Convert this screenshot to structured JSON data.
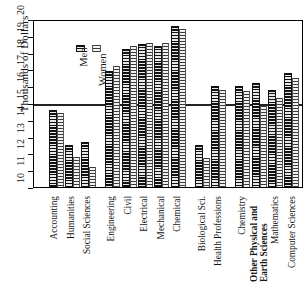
{
  "chart_data": {
    "type": "bar",
    "title": "",
    "xlabel": "",
    "ylabel": "Thousands of Dollars",
    "ylim": [
      10,
      20
    ],
    "ytick_labels": [
      "10",
      "11",
      "12",
      "13",
      "14",
      "15",
      "16",
      "17",
      "18",
      "19",
      "20"
    ],
    "grid": "single horizontal line at 15",
    "legend_position": "top-left inside plot",
    "categories": [
      "Accounting",
      "Humanities",
      "Social Sciences",
      "Engineering",
      "Civil",
      "Electrical",
      "Mechanical",
      "Chemical",
      "Biological Sci.",
      "Health Professions",
      "Chemistry",
      "Other Physical and Earth Sciences",
      "Mathematics",
      "Computer Sciences"
    ],
    "series": [
      {
        "name": "Men",
        "values": [
          14.6,
          12.5,
          12.7,
          16.9,
          18.2,
          18.5,
          18.4,
          19.6,
          12.5,
          16.0,
          16.0,
          16.2,
          15.8,
          16.8
        ]
      },
      {
        "name": "Women",
        "values": [
          14.4,
          11.8,
          11.2,
          17.2,
          18.4,
          18.6,
          18.6,
          19.4,
          11.7,
          15.8,
          15.7,
          14.8,
          15.3,
          16.5
        ]
      }
    ]
  },
  "legend": {
    "men_label": "Men",
    "women_label": "Women",
    "men_swatch": "hatched-dark-swatch",
    "women_swatch": "hatched-light-swatch"
  },
  "axis": {
    "y_title": "Thousands of Dollars"
  },
  "group_spans": [
    {
      "label": "Accounting",
      "gap_after": false
    },
    {
      "label": "Humanities",
      "gap_after": false
    },
    {
      "label": "Social Sciences",
      "gap_after": true
    },
    {
      "label": "Engineering",
      "gap_after": false
    },
    {
      "label": "Civil",
      "gap_after": false
    },
    {
      "label": "Electrical",
      "gap_after": false
    },
    {
      "label": "Mechanical",
      "gap_after": false
    },
    {
      "label": "Chemical",
      "gap_after": true
    },
    {
      "label": "Biological Sci.",
      "gap_after": false
    },
    {
      "label": "Health Professions",
      "gap_after": true
    },
    {
      "label": "Chemistry",
      "gap_after": false
    },
    {
      "label": "Other Physical and Earth Sciences",
      "gap_after": false
    },
    {
      "label": "Mathematics",
      "gap_after": false
    },
    {
      "label": "Computer Sciences",
      "gap_after": false
    }
  ]
}
